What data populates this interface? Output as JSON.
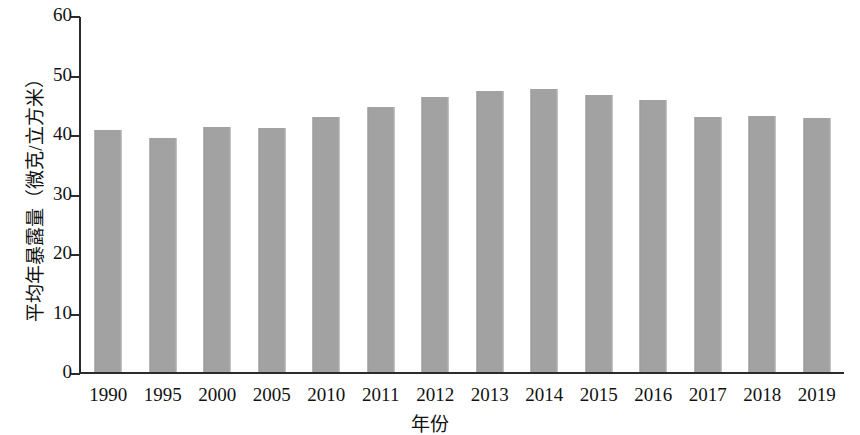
{
  "chart_data": {
    "type": "bar",
    "title": "",
    "xlabel": "年份",
    "ylabel": "平均年暴露量（微克/立方米）",
    "categories": [
      "1990",
      "1995",
      "2000",
      "2005",
      "2010",
      "2011",
      "2012",
      "2013",
      "2014",
      "2015",
      "2016",
      "2017",
      "2018",
      "2019"
    ],
    "values": [
      40.6,
      39.4,
      41.2,
      41.0,
      42.8,
      44.6,
      46.3,
      47.3,
      47.6,
      46.5,
      45.7,
      42.8,
      43.1,
      42.7
    ],
    "series": [
      {
        "name": "平均年暴露量",
        "values": [
          40.6,
          39.4,
          41.2,
          41.0,
          42.8,
          44.6,
          46.3,
          47.3,
          47.6,
          46.5,
          45.7,
          42.8,
          43.1,
          42.7
        ]
      }
    ],
    "ylim": [
      0,
      60
    ],
    "yticks": [
      0,
      10,
      20,
      30,
      40,
      50,
      60
    ],
    "ytick_labels": [
      "0",
      "10",
      "20",
      "30",
      "40",
      "50",
      "60"
    ],
    "grid": false,
    "legend": false,
    "bar_color": "#a2a2a2",
    "axis_color": "#2b2b2b",
    "background_color": "#ffffff"
  }
}
